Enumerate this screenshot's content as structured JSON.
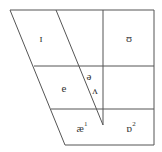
{
  "diagram": {
    "line_color": "#555555",
    "symbols": [
      {
        "id": "near-close-front",
        "text": "ɪ",
        "sup": ""
      },
      {
        "id": "near-close-back",
        "text": "ʊ",
        "sup": ""
      },
      {
        "id": "mid-front",
        "text": "e",
        "sup": ""
      },
      {
        "id": "mid-central",
        "text": "ə",
        "sup": ""
      },
      {
        "id": "open-mid-back-unrounded",
        "text": "ʌ",
        "sup": ""
      },
      {
        "id": "near-open-front",
        "text": "æ",
        "sup": "1"
      },
      {
        "id": "open-back-rounded",
        "text": "ɒ",
        "sup": "2"
      }
    ]
  }
}
